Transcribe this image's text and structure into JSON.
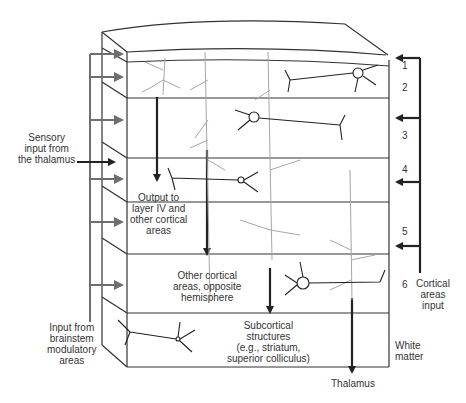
{
  "colors": {
    "line": "#333333",
    "gray_arrow": "#6e6e6e",
    "gray_neuron": "#a6a6a6",
    "dark_neuron": "#222222"
  },
  "layers": [
    "1",
    "2",
    "3",
    "4",
    "5",
    "6"
  ],
  "white_matter": "White\nmatter",
  "labels": {
    "sensory_input": "Sensory\ninput from\nthe thalamus",
    "brainstem_input": "Input from\nbrainstem\nmodulatory\nareas",
    "output_layer4": "Output to\nlayer IV and\nother cortical\nareas",
    "other_cortical": "Other cortical\nareas, opposite\nhemisphere",
    "subcortical": "Subcortical\nstructures\n(e.g., striatum,\nsuperior colliculus)",
    "cortical_input": "Cortical\nareas\ninput",
    "thalamus": "Thalamus"
  }
}
